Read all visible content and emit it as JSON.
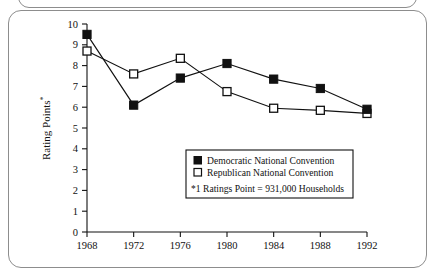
{
  "chart_data": {
    "type": "line",
    "title": "",
    "xlabel": "",
    "ylabel": "Rating Points*",
    "ylabel_base": "Rating Points",
    "ylabel_superscript": "*",
    "categories": [
      "1968",
      "1972",
      "1976",
      "1980",
      "1984",
      "1988",
      "1992"
    ],
    "x": [
      1968,
      1972,
      1976,
      1980,
      1984,
      1988,
      1992
    ],
    "xlim": [
      1968,
      1992
    ],
    "ylim": [
      0,
      10
    ],
    "y_ticks": [
      "0",
      "1",
      "2",
      "3",
      "4",
      "5",
      "6",
      "7",
      "8",
      "9",
      "10"
    ],
    "grid": false,
    "legend_position": "inside-lower-right",
    "series": [
      {
        "name": "Democratic National Convention",
        "marker": "filled-square",
        "color": "#111111",
        "values": [
          9.5,
          6.1,
          7.4,
          8.1,
          7.35,
          6.9,
          5.9
        ]
      },
      {
        "name": "Republican National Convention",
        "marker": "open-square",
        "color": "#ffffff",
        "values": [
          8.7,
          7.6,
          8.35,
          6.75,
          5.95,
          5.85,
          5.7
        ]
      }
    ],
    "annotations": [
      "*1 Ratings Point = 931,000 Households"
    ]
  },
  "legend": {
    "entries": [
      {
        "label": "Democratic National Convention",
        "marker": "filled-square"
      },
      {
        "label": "Republican National Convention",
        "marker": "open-square"
      }
    ],
    "footnote": "*1 Ratings Point = 931,000 Households"
  }
}
